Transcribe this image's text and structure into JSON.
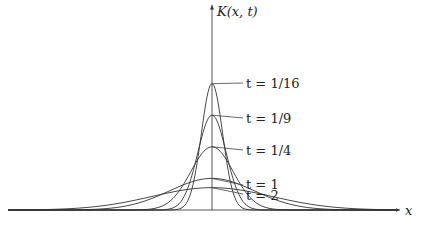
{
  "chart_data": {
    "type": "line",
    "title": "",
    "xlabel": "x",
    "ylabel": "K(x, t)",
    "function": "K(x,t) = (1/sqrt(4*pi*t)) * exp(-x^2/(4t))",
    "grid": false,
    "legend_position": "inline labels right of peaks",
    "series": [
      {
        "name": "t = 1/16",
        "t": 0.0625,
        "peak": 1.128
      },
      {
        "name": "t = 1/9",
        "t": 0.1111,
        "peak": 0.846
      },
      {
        "name": "t = 1/4",
        "t": 0.25,
        "peak": 0.564
      },
      {
        "name": "t = 1",
        "t": 1.0,
        "peak": 0.282
      },
      {
        "name": "t = 2",
        "t": 2.0,
        "peak": 0.199
      }
    ],
    "xlim": [
      -7,
      6.3
    ],
    "ylim": [
      0,
      1.8
    ]
  },
  "labels": {
    "y_axis": "K(x, t)",
    "x_axis": "x",
    "curves": [
      "t = 1/16",
      "t = 1/9",
      "t = 1/4",
      "t = 1",
      "t = 2"
    ]
  },
  "colors": {
    "line": "#333333",
    "background": "#ffffff"
  }
}
